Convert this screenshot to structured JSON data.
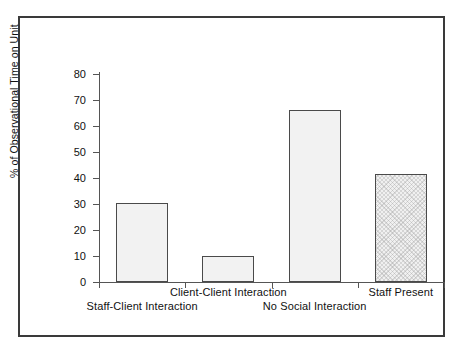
{
  "chart_data": {
    "type": "bar",
    "title": "",
    "xlabel": "",
    "ylabel": "% of Observational Time on Unit",
    "ylim": [
      0,
      80
    ],
    "yticks": [
      0,
      10,
      20,
      30,
      40,
      50,
      60,
      70,
      80
    ],
    "ytick_labels": [
      "0",
      "10",
      "20",
      "30",
      "40",
      "50",
      "60",
      "70",
      "80"
    ],
    "grid": false,
    "legend": "none",
    "categories": [
      "Staff-Client Interaction",
      "Client-Client Interaction",
      "No Social Interaction",
      "Staff Present"
    ],
    "values": [
      30.5,
      10,
      66,
      41.5
    ],
    "bar_styles": [
      "solid-light",
      "solid-light",
      "solid-light",
      "checkered-light"
    ],
    "label_rows": [
      "lower",
      "upper",
      "lower",
      "upper"
    ]
  },
  "axis": {
    "y_title": "% of Observational Time on Unit"
  },
  "colors": {
    "frame": "#3a3a3a",
    "axis": "#555555",
    "bar_fill": "#f2f2f2",
    "bar_edge": "#4a4a4a",
    "text": "#111111",
    "background": "#ffffff"
  }
}
